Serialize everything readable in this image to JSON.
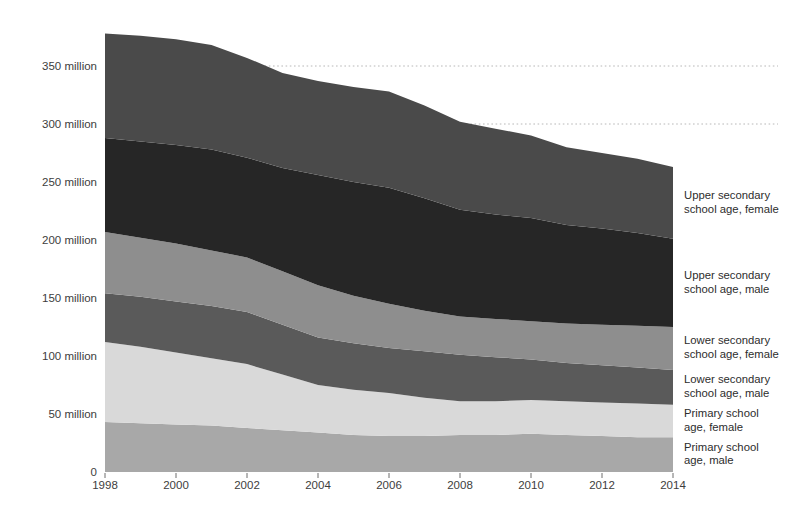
{
  "page": {
    "background_color": "#ffffff",
    "text_color": "#3d3d3d"
  },
  "chart_data": {
    "type": "area",
    "stacked": true,
    "title": "",
    "xlabel": "",
    "ylabel": "",
    "unit": "million",
    "grid": "dotted horizontal at 300 and 350 million",
    "legend_position": "right edge, one label per band",
    "x": [
      1998,
      1999,
      2000,
      2001,
      2002,
      2003,
      2004,
      2005,
      2006,
      2007,
      2008,
      2009,
      2010,
      2011,
      2012,
      2013,
      2014
    ],
    "x_ticks": [
      1998,
      2000,
      2002,
      2004,
      2006,
      2008,
      2010,
      2012,
      2014
    ],
    "ylim": [
      0,
      380
    ],
    "y_axis": [
      {
        "value": 0,
        "label": "0"
      },
      {
        "value": 50,
        "label": "50 million"
      },
      {
        "value": 100,
        "label": "100 million"
      },
      {
        "value": 150,
        "label": "150 million"
      },
      {
        "value": 200,
        "label": "200 million"
      },
      {
        "value": 250,
        "label": "250 million"
      },
      {
        "value": 300,
        "label": "300 million"
      },
      {
        "value": 350,
        "label": "350 million"
      }
    ],
    "y_gridlines": [
      300,
      350
    ],
    "series": [
      {
        "name": "Primary school age, male",
        "label_lines": [
          "Primary school",
          "age, male"
        ],
        "color": "#a8a8a8",
        "values": [
          43,
          42,
          41,
          40,
          38,
          36,
          34,
          32,
          31,
          31,
          32,
          32,
          33,
          32,
          31,
          30,
          30
        ]
      },
      {
        "name": "Primary school age, female",
        "label_lines": [
          "Primary school",
          "age, female"
        ],
        "color": "#d9d9d9",
        "values": [
          69,
          66,
          62,
          58,
          55,
          48,
          41,
          39,
          37,
          33,
          29,
          29,
          29,
          29,
          29,
          29,
          28
        ]
      },
      {
        "name": "Lower secondary school age, male",
        "label_lines": [
          "Lower secondary",
          "school age, male"
        ],
        "color": "#5a5a5a",
        "values": [
          42,
          43,
          44,
          45,
          45,
          43,
          41,
          40,
          39,
          40,
          40,
          38,
          35,
          33,
          32,
          31,
          30
        ]
      },
      {
        "name": "Lower secondary school age, female",
        "label_lines": [
          "Lower secondary",
          "school age, female"
        ],
        "color": "#8e8e8e",
        "values": [
          53,
          51,
          50,
          48,
          47,
          46,
          45,
          41,
          38,
          35,
          33,
          33,
          33,
          34,
          35,
          36,
          37
        ]
      },
      {
        "name": "Upper secondary school age, male",
        "label_lines": [
          "Upper secondary",
          "school age, male"
        ],
        "color": "#262626",
        "values": [
          81,
          83,
          85,
          87,
          86,
          89,
          95,
          98,
          100,
          97,
          92,
          90,
          89,
          85,
          83,
          80,
          76
        ]
      },
      {
        "name": "Upper secondary school age, female",
        "label_lines": [
          "Upper secondary",
          "school age, female"
        ],
        "color": "#4a4a4a",
        "values": [
          90,
          91,
          91,
          90,
          86,
          82,
          81,
          82,
          83,
          80,
          76,
          74,
          71,
          67,
          65,
          64,
          62
        ]
      }
    ],
    "totals_by_year": [
      378,
      376,
      373,
      368,
      357,
      344,
      337,
      332,
      328,
      316,
      302,
      296,
      290,
      280,
      274,
      269,
      263
    ]
  }
}
